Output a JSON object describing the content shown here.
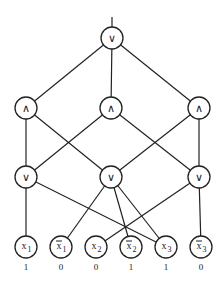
{
  "diagram": {
    "type": "boolean-circuit",
    "root": {
      "id": "root",
      "symbol": "∨",
      "x": 112,
      "y": 38
    },
    "and_layer": [
      {
        "id": "a1",
        "symbol": "∧",
        "x": 26,
        "y": 108
      },
      {
        "id": "a2",
        "symbol": "∧",
        "x": 111,
        "y": 108
      },
      {
        "id": "a3",
        "symbol": "∧",
        "x": 199,
        "y": 108
      }
    ],
    "or_layer": [
      {
        "id": "o1",
        "symbol": "∨",
        "x": 26,
        "y": 177
      },
      {
        "id": "o2",
        "symbol": "∨",
        "x": 111,
        "y": 177
      },
      {
        "id": "o3",
        "symbol": "∨",
        "x": 199,
        "y": 177
      }
    ],
    "leaves": [
      {
        "id": "x1",
        "var": "x",
        "sub": "1",
        "negated": false,
        "value": "1",
        "x": 26,
        "y": 247
      },
      {
        "id": "nx1",
        "var": "x",
        "sub": "1",
        "negated": true,
        "value": "0",
        "x": 61,
        "y": 247
      },
      {
        "id": "x2",
        "var": "x",
        "sub": "2",
        "negated": false,
        "value": "0",
        "x": 96,
        "y": 247
      },
      {
        "id": "nx2",
        "var": "x",
        "sub": "2",
        "negated": true,
        "value": "1",
        "x": 131,
        "y": 247
      },
      {
        "id": "x3",
        "var": "x",
        "sub": "3",
        "negated": false,
        "value": "1",
        "x": 166,
        "y": 247
      },
      {
        "id": "nx3",
        "var": "x",
        "sub": "3",
        "negated": true,
        "value": "0",
        "x": 201,
        "y": 247
      }
    ],
    "edges": [
      [
        "root",
        "a1"
      ],
      [
        "root",
        "a2"
      ],
      [
        "root",
        "a3"
      ],
      [
        "a1",
        "o1"
      ],
      [
        "a1",
        "o2"
      ],
      [
        "a2",
        "o1"
      ],
      [
        "a2",
        "o3"
      ],
      [
        "a3",
        "o2"
      ],
      [
        "a3",
        "o3"
      ],
      [
        "o1",
        "x1"
      ],
      [
        "o1",
        "x3"
      ],
      [
        "o2",
        "nx1"
      ],
      [
        "o2",
        "nx2"
      ],
      [
        "o2",
        "x3"
      ],
      [
        "o3",
        "x2"
      ],
      [
        "o3",
        "nx3"
      ]
    ],
    "output_line": {
      "x": 112,
      "y_top": 17
    },
    "node_radius": 11
  }
}
